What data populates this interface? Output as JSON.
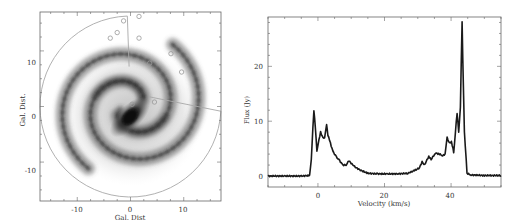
{
  "chart_data": [
    {
      "type": "heatmap",
      "title": "",
      "description": "Grayscale face-on spiral galaxy map with a sector wedge outlined and small circles marking sources",
      "xlabel": "Gal. Dist",
      "ylabel": "Gal. Dist.",
      "xlim": [
        -17,
        17
      ],
      "ylim": [
        -17,
        17
      ],
      "xticks": [
        -10,
        0,
        10
      ],
      "yticks": [
        -10,
        0,
        10
      ],
      "xtick_labels": [
        "-10",
        "0",
        "10"
      ],
      "ytick_labels": [
        "-10",
        "0",
        "10"
      ],
      "grid": false,
      "annotations": {
        "outline_circle_radius": 17,
        "sector_boundary_angles_deg": [
          92,
          -3
        ],
        "marker_circles": [
          [
            -1.3,
            15.4
          ],
          [
            1.6,
            16.2
          ],
          [
            -2.5,
            13.3
          ],
          [
            -3.8,
            12.3
          ],
          [
            1.6,
            12.3
          ],
          [
            7.6,
            9.5
          ],
          [
            9.6,
            6.2
          ],
          [
            3.6,
            7.8
          ],
          [
            0.3,
            0.4
          ],
          [
            4.5,
            0.8
          ]
        ]
      }
    },
    {
      "type": "line",
      "title": "",
      "xlabel": "Velocity (km/s)",
      "ylabel": "Flux (Jy)",
      "xlim": [
        -15,
        55
      ],
      "ylim": [
        -2,
        29
      ],
      "xticks": [
        0,
        20,
        40
      ],
      "yticks": [
        0,
        10,
        20
      ],
      "xtick_labels": [
        "0",
        "20",
        "40"
      ],
      "ytick_labels": [
        "0",
        "10",
        "20"
      ],
      "grid": false,
      "series": [
        {
          "name": "spectrum",
          "x": [
            -15,
            -10,
            -5,
            -2.5,
            -2,
            -1.5,
            -1.2,
            -0.8,
            -0.3,
            0.3,
            0.8,
            1.5,
            2.0,
            2.6,
            3.0,
            3.5,
            4.5,
            5.5,
            6.5,
            7.5,
            8.5,
            9.3,
            10.0,
            11.5,
            13,
            15,
            18,
            21,
            24,
            27,
            29,
            30.5,
            31.3,
            32,
            33.3,
            34,
            35.3,
            36.5,
            37.5,
            38.2,
            38.8,
            39.5,
            40.1,
            40.8,
            41.3,
            41.8,
            42.3,
            42.8,
            43.3,
            44.0,
            44.8,
            46,
            50,
            55
          ],
          "y": [
            0,
            0,
            0,
            0.1,
            3,
            9,
            12,
            9,
            4.5,
            6.5,
            8,
            7,
            7,
            9.5,
            7.5,
            6.5,
            4.5,
            3.5,
            2.8,
            2,
            2,
            2.8,
            2.3,
            1.5,
            1,
            0.5,
            0.4,
            0.4,
            0.4,
            0.5,
            1,
            1.5,
            2.6,
            2,
            3.6,
            3,
            4.2,
            4,
            3.7,
            4,
            7,
            6,
            6.3,
            4.3,
            8,
            11.5,
            8,
            12.5,
            28,
            8,
            0.5,
            0.2,
            0.1,
            0.1
          ]
        }
      ]
    }
  ],
  "left_panel": {
    "xlabel": "Gal. Dist",
    "ylabel": "Gal. Dist.",
    "xticks": [
      "-10",
      "0",
      "10"
    ],
    "yticks": [
      "10",
      "0",
      "-10"
    ]
  },
  "right_panel": {
    "xlabel": "Velocity (km/s)",
    "ylabel": "Flux (Jy)",
    "xticks": [
      "0",
      "20",
      "40"
    ],
    "yticks": [
      "20",
      "10",
      "0"
    ]
  },
  "colors": {
    "frame": "#666666",
    "outline": "#a8a8a8",
    "line": "#1a1a1a",
    "galaxy_dark": "#1e1e1e"
  }
}
